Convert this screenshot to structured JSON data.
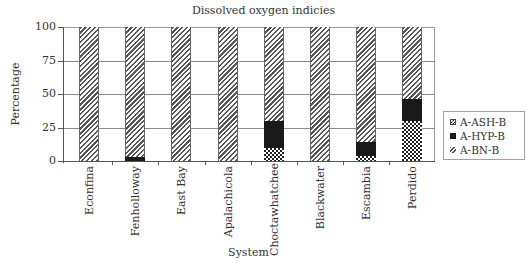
{
  "chart_data": {
    "type": "bar",
    "stacked": true,
    "title": "Dissolved oxygen indicies",
    "xlabel": "System",
    "ylabel": "Percentage",
    "ylim": [
      0,
      100
    ],
    "yticks": [
      "0",
      "25",
      "50",
      "75",
      "100"
    ],
    "grid": true,
    "legend_position": "right",
    "categories": [
      "Econfina",
      "Fenholloway",
      "East Bay",
      "Apalachicola",
      "Choctawhatchee",
      "Blackwater",
      "Escambia",
      "Perdido"
    ],
    "series": [
      {
        "name": "A-ASH-B",
        "pattern": "checkered",
        "values": [
          0,
          0,
          0,
          0,
          10,
          0,
          4,
          30
        ]
      },
      {
        "name": "A-HYP-B",
        "pattern": "solid-black",
        "values": [
          0,
          3,
          0,
          0,
          20,
          0,
          10,
          16
        ]
      },
      {
        "name": "A-BN-B",
        "pattern": "diagonal-hatch",
        "values": [
          100,
          97,
          100,
          100,
          70,
          100,
          86,
          54
        ]
      }
    ]
  }
}
